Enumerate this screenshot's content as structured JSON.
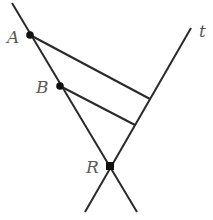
{
  "diagram": {
    "colors": {
      "line": "#2a2a2a",
      "label": "#5a5a5a",
      "point": "#111111"
    },
    "points": {
      "A": {
        "label": "A",
        "x": 30,
        "y": 35
      },
      "B": {
        "label": "B",
        "x": 60,
        "y": 86
      },
      "R": {
        "label": "R",
        "x": 110,
        "y": 166
      }
    },
    "lines": {
      "t": {
        "label": "t"
      }
    }
  }
}
